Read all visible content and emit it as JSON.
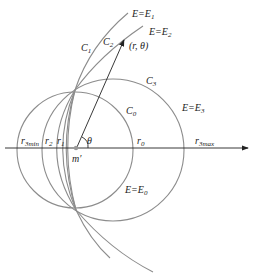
{
  "diagram": {
    "curves": {
      "C1": "C",
      "C2": "C",
      "C3": "C",
      "C0": "C"
    },
    "labels": {
      "E1": {
        "main": "E=E",
        "sub": "1"
      },
      "E2": {
        "main": "E=E",
        "sub": "2"
      },
      "E3": {
        "main": "E=E",
        "sub": "3"
      },
      "E0": {
        "main": "E=E",
        "sub": "0"
      },
      "C1": {
        "main": "C",
        "sub": "1"
      },
      "C2": {
        "main": "C",
        "sub": "2"
      },
      "C3": {
        "main": "C",
        "sub": "3"
      },
      "C0": {
        "main": "C",
        "sub": "0"
      },
      "point": "(r, θ)",
      "theta": "θ",
      "origin": "m′",
      "r3min": {
        "main": "r",
        "sub": "3min"
      },
      "r2": {
        "main": "r",
        "sub": "2"
      },
      "r1": {
        "main": "r",
        "sub": "1"
      },
      "r0": {
        "main": "r",
        "sub": "0"
      },
      "r3max": {
        "main": "r",
        "sub": "3max"
      }
    }
  }
}
